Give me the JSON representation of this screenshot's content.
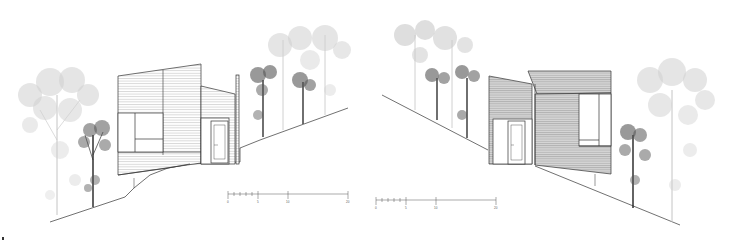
{
  "drawing": {
    "type": "architectural-elevations",
    "background": "#ffffff",
    "line_color": "#333333",
    "siding_color": "#b8b8b8",
    "tree_light_color": "#bdbdbd",
    "tree_dark_color": "#3a3a3a"
  },
  "elevations": [
    {
      "name": "left-elevation",
      "description": "Side elevation of house on sloped site, slope rising to the right"
    },
    {
      "name": "right-elevation",
      "description": "Side elevation of house on sloped site, slope rising to the left"
    }
  ],
  "scale_bars": [
    {
      "name": "scale-bar-left",
      "labels": [
        "0",
        "5",
        "10",
        "20"
      ]
    },
    {
      "name": "scale-bar-right",
      "labels": [
        "0",
        "5",
        "10",
        "20"
      ]
    }
  ]
}
